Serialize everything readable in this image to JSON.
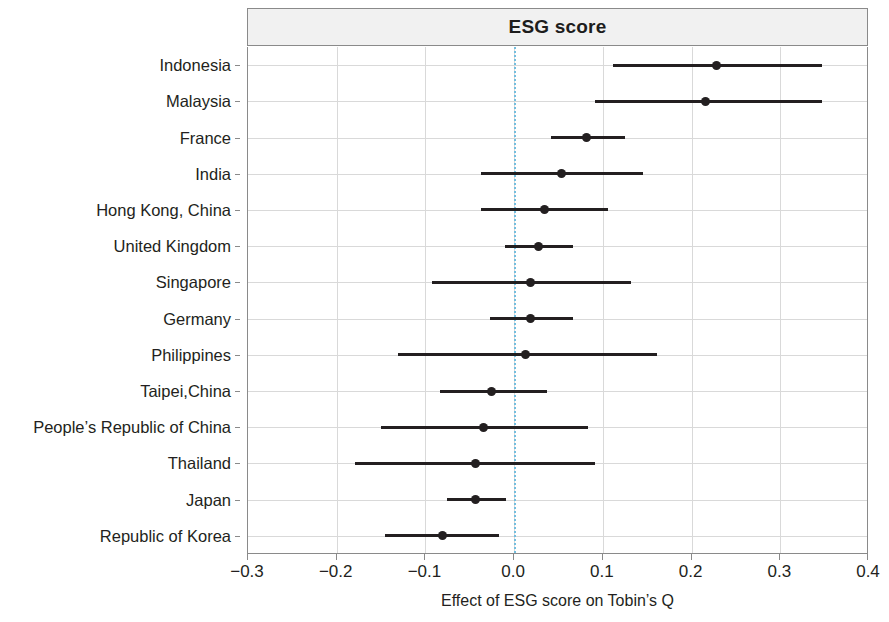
{
  "chart_data": {
    "type": "scatter",
    "subtype": "forest-plot",
    "title": "ESG score",
    "xlabel": "Effect of ESG score on Tobin’s Q",
    "ylabel": "",
    "xlim": [
      -0.3,
      0.4
    ],
    "xticks": [
      -0.3,
      -0.2,
      -0.1,
      0.0,
      0.1,
      0.2,
      0.3,
      0.4
    ],
    "xtick_labels": [
      "−0.3",
      "−0.2",
      "−0.1",
      "0.0",
      "0.1",
      "0.2",
      "0.3",
      "0.4"
    ],
    "grid": true,
    "legend": "none",
    "reference_line": {
      "value": 0.0,
      "style": "dotted",
      "color": "#74bede"
    },
    "categories": [
      "Indonesia",
      "Malaysia",
      "France",
      "India",
      "Hong Kong, China",
      "United Kingdom",
      "Singapore",
      "Germany",
      "Philippines",
      "Taipei,China",
      "People’s Republic of China",
      "Thailand",
      "Japan",
      "Republic of Korea"
    ],
    "estimates": [
      0.228,
      0.216,
      0.081,
      0.053,
      0.034,
      0.027,
      0.019,
      0.018,
      0.013,
      -0.026,
      -0.035,
      -0.043,
      -0.044,
      -0.081
    ],
    "ci_low": [
      0.112,
      0.092,
      0.043,
      -0.036,
      -0.036,
      -0.009,
      -0.092,
      -0.026,
      -0.13,
      -0.082,
      -0.149,
      -0.178,
      -0.074,
      -0.144
    ],
    "ci_high": [
      0.345,
      0.345,
      0.123,
      0.143,
      0.103,
      0.064,
      0.13,
      0.064,
      0.159,
      0.035,
      0.081,
      0.089,
      -0.011,
      -0.019
    ],
    "points": [
      {
        "label": "Indonesia",
        "estimate": 0.228,
        "ci_low": 0.112,
        "ci_high": 0.345
      },
      {
        "label": "Malaysia",
        "estimate": 0.216,
        "ci_low": 0.092,
        "ci_high": 0.345
      },
      {
        "label": "France",
        "estimate": 0.081,
        "ci_low": 0.043,
        "ci_high": 0.123
      },
      {
        "label": "India",
        "estimate": 0.053,
        "ci_low": -0.036,
        "ci_high": 0.143
      },
      {
        "label": "Hong Kong, China",
        "estimate": 0.034,
        "ci_low": -0.036,
        "ci_high": 0.103
      },
      {
        "label": "United Kingdom",
        "estimate": 0.027,
        "ci_low": -0.009,
        "ci_high": 0.064
      },
      {
        "label": "Singapore",
        "estimate": 0.019,
        "ci_low": -0.092,
        "ci_high": 0.13
      },
      {
        "label": "Germany",
        "estimate": 0.018,
        "ci_low": -0.026,
        "ci_high": 0.064
      },
      {
        "label": "Philippines",
        "estimate": 0.013,
        "ci_low": -0.13,
        "ci_high": 0.159
      },
      {
        "label": "Taipei,China",
        "estimate": -0.026,
        "ci_low": -0.082,
        "ci_high": 0.035
      },
      {
        "label": "People’s Republic of China",
        "estimate": -0.035,
        "ci_low": -0.149,
        "ci_high": 0.081
      },
      {
        "label": "Thailand",
        "estimate": -0.043,
        "ci_low": -0.178,
        "ci_high": 0.089
      },
      {
        "label": "Japan",
        "estimate": -0.044,
        "ci_low": -0.074,
        "ci_high": -0.011
      },
      {
        "label": "Republic of Korea",
        "estimate": -0.081,
        "ci_low": -0.144,
        "ci_high": -0.019
      }
    ]
  }
}
